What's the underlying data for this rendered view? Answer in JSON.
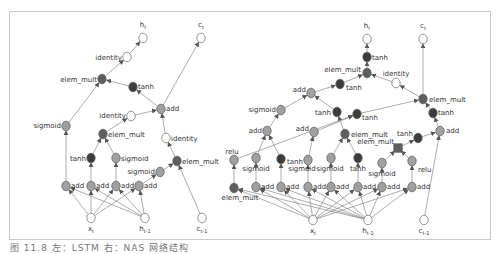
{
  "caption": "图 11.8  左：LSTM 右：NAS 网络结构",
  "colors": {
    "dark": "#3c3c3c",
    "medium": "#5e5e5e",
    "light": "#a0a0a0",
    "white": "#ffffff",
    "stroke": "#7a7a7a",
    "edge": "#8a8a8a"
  },
  "graphs": [
    {
      "name": "lstm-cell",
      "nodes": [
        {
          "id": "ht",
          "x": 143,
          "y": 38,
          "type": "white",
          "label": "h",
          "sub": "t",
          "lx": 143,
          "ly": 27,
          "anchor": "middle",
          "kind": "output"
        },
        {
          "id": "ct",
          "x": 201,
          "y": 38,
          "type": "white",
          "label": "c",
          "sub": "t",
          "lx": 201,
          "ly": 27,
          "anchor": "middle",
          "kind": "output"
        },
        {
          "id": "id1",
          "x": 127,
          "y": 57,
          "type": "white",
          "label": "identity",
          "lx": 122,
          "ly": 60,
          "anchor": "end"
        },
        {
          "id": "em1",
          "x": 102,
          "y": 79,
          "type": "medium",
          "label": "elem_mult",
          "lx": 97,
          "ly": 82,
          "anchor": "end"
        },
        {
          "id": "th1",
          "x": 133,
          "y": 87,
          "type": "dark",
          "label": "tanh",
          "lx": 138,
          "ly": 89,
          "anchor": "start"
        },
        {
          "id": "add1",
          "x": 161,
          "y": 109,
          "type": "light",
          "label": "add",
          "lx": 166,
          "ly": 111,
          "anchor": "start"
        },
        {
          "id": "sg1",
          "x": 66,
          "y": 126,
          "type": "light",
          "label": "sigmoid",
          "lx": 61,
          "ly": 128,
          "anchor": "end"
        },
        {
          "id": "id2",
          "x": 131,
          "y": 116,
          "type": "white",
          "label": "identity",
          "lx": 126,
          "ly": 118,
          "anchor": "end"
        },
        {
          "id": "em2",
          "x": 103,
          "y": 134,
          "type": "medium",
          "label": "elem_mult",
          "lx": 108,
          "ly": 137,
          "anchor": "start"
        },
        {
          "id": "id3",
          "x": 166,
          "y": 138,
          "type": "white",
          "label": "identity",
          "lx": 171,
          "ly": 141,
          "anchor": "start"
        },
        {
          "id": "th2",
          "x": 91,
          "y": 158,
          "type": "dark",
          "label": "tanh",
          "lx": 86,
          "ly": 161,
          "anchor": "end"
        },
        {
          "id": "sg2",
          "x": 116,
          "y": 158,
          "type": "light",
          "label": "sigmoid",
          "lx": 121,
          "ly": 161,
          "anchor": "start"
        },
        {
          "id": "em3",
          "x": 177,
          "y": 161,
          "type": "medium",
          "label": "elem_mult",
          "lx": 182,
          "ly": 164,
          "anchor": "start"
        },
        {
          "id": "sg3",
          "x": 160,
          "y": 172,
          "type": "light",
          "label": "sigmoid",
          "lx": 155,
          "ly": 174,
          "anchor": "end"
        },
        {
          "id": "a1",
          "x": 66,
          "y": 186,
          "type": "light",
          "label": "add",
          "lx": 71,
          "ly": 188,
          "anchor": "start"
        },
        {
          "id": "a2",
          "x": 91,
          "y": 186,
          "type": "light",
          "label": "add",
          "lx": 96,
          "ly": 188,
          "anchor": "start"
        },
        {
          "id": "a3",
          "x": 116,
          "y": 186,
          "type": "light",
          "label": "add",
          "lx": 121,
          "ly": 188,
          "anchor": "start"
        },
        {
          "id": "a4",
          "x": 139,
          "y": 186,
          "type": "light",
          "label": "add",
          "lx": 144,
          "ly": 188,
          "anchor": "start"
        },
        {
          "id": "xt",
          "x": 91,
          "y": 218,
          "type": "white",
          "label": "x",
          "sub": "t",
          "lx": 91,
          "ly": 231,
          "anchor": "middle",
          "kind": "input"
        },
        {
          "id": "htm1",
          "x": 145,
          "y": 218,
          "type": "white",
          "label": "h",
          "sub": "t-1",
          "lx": 145,
          "ly": 231,
          "anchor": "middle",
          "kind": "input"
        },
        {
          "id": "ctm1",
          "x": 202,
          "y": 218,
          "type": "white",
          "label": "c",
          "sub": "t-1",
          "lx": 202,
          "ly": 231,
          "anchor": "middle",
          "kind": "input"
        }
      ],
      "edges": [
        [
          "id1",
          "ht"
        ],
        [
          "em1",
          "id1"
        ],
        [
          "th1",
          "em1"
        ],
        [
          "add1",
          "th1"
        ],
        [
          "add1",
          "ct"
        ],
        [
          "sg1",
          "em1"
        ],
        [
          "id2",
          "add1"
        ],
        [
          "em2",
          "id2"
        ],
        [
          "id3",
          "add1"
        ],
        [
          "em3",
          "id3"
        ],
        [
          "th2",
          "em2"
        ],
        [
          "sg2",
          "em2"
        ],
        [
          "sg3",
          "em3"
        ],
        [
          "ctm1",
          "em3"
        ],
        [
          "a1",
          "sg1"
        ],
        [
          "a2",
          "th2"
        ],
        [
          "a3",
          "sg2"
        ],
        [
          "a4",
          "sg3"
        ],
        [
          "xt",
          "a1"
        ],
        [
          "xt",
          "a2"
        ],
        [
          "xt",
          "a3"
        ],
        [
          "xt",
          "a4"
        ],
        [
          "htm1",
          "a1"
        ],
        [
          "htm1",
          "a2"
        ],
        [
          "htm1",
          "a3"
        ],
        [
          "htm1",
          "a4"
        ]
      ]
    },
    {
      "name": "nas-cell",
      "nodes": [
        {
          "id": "ht",
          "x": 367,
          "y": 39,
          "type": "white",
          "label": "h",
          "sub": "t",
          "lx": 367,
          "ly": 28,
          "anchor": "middle",
          "kind": "output"
        },
        {
          "id": "ct",
          "x": 423,
          "y": 39,
          "type": "white",
          "label": "c",
          "sub": "t",
          "lx": 423,
          "ly": 28,
          "anchor": "middle",
          "kind": "output"
        },
        {
          "id": "th1",
          "x": 367,
          "y": 57,
          "type": "dark",
          "label": "tanh",
          "lx": 372,
          "ly": 60,
          "anchor": "start"
        },
        {
          "id": "em1",
          "x": 367,
          "y": 73,
          "type": "medium",
          "label": "elem_mult",
          "lx": 361,
          "ly": 72,
          "anchor": "end"
        },
        {
          "id": "th2",
          "x": 340,
          "y": 84,
          "type": "dark",
          "label": "tanh",
          "lx": 346,
          "ly": 90,
          "anchor": "start"
        },
        {
          "id": "id1",
          "x": 396,
          "y": 83,
          "type": "white",
          "label": "identity",
          "lx": 396,
          "ly": 76,
          "anchor": "middle"
        },
        {
          "id": "add1",
          "x": 311,
          "y": 93,
          "type": "light",
          "label": "add",
          "lx": 306,
          "ly": 92,
          "anchor": "end"
        },
        {
          "id": "em2",
          "x": 423,
          "y": 99,
          "type": "medium",
          "label": "elem_mult",
          "lx": 429,
          "ly": 102,
          "anchor": "start"
        },
        {
          "id": "sg1",
          "x": 281,
          "y": 110,
          "type": "light",
          "label": "sigmoid",
          "lx": 276,
          "ly": 112,
          "anchor": "end"
        },
        {
          "id": "th3",
          "x": 337,
          "y": 112,
          "type": "dark",
          "label": "tanh",
          "lx": 331,
          "ly": 115,
          "anchor": "end"
        },
        {
          "id": "th4",
          "x": 357,
          "y": 114,
          "type": "dark",
          "label": "tanh",
          "lx": 362,
          "ly": 120,
          "anchor": "start"
        },
        {
          "id": "th5",
          "x": 433,
          "y": 113,
          "type": "dark",
          "label": "tanh",
          "lx": 438,
          "ly": 115,
          "anchor": "start"
        },
        {
          "id": "add2",
          "x": 267,
          "y": 131,
          "type": "light",
          "label": "add",
          "lx": 262,
          "ly": 133,
          "anchor": "end"
        },
        {
          "id": "add3",
          "x": 314,
          "y": 132,
          "type": "light",
          "label": "add",
          "lx": 309,
          "ly": 131,
          "anchor": "end"
        },
        {
          "id": "em3",
          "x": 345,
          "y": 134,
          "type": "medium",
          "label": "elem_mult",
          "lx": 351,
          "ly": 137,
          "anchor": "start"
        },
        {
          "id": "add4",
          "x": 440,
          "y": 131,
          "type": "light",
          "label": "add",
          "lx": 446,
          "ly": 133,
          "anchor": "start"
        },
        {
          "id": "th6",
          "x": 418,
          "y": 138,
          "type": "dark",
          "label": "tanh",
          "lx": 413,
          "ly": 136,
          "anchor": "end"
        },
        {
          "id": "em4",
          "x": 398,
          "y": 148,
          "type": "medium",
          "label": "elem_mult",
          "lx": 394,
          "ly": 144,
          "anchor": "end",
          "shape": "square"
        },
        {
          "id": "relu1",
          "x": 234,
          "y": 160,
          "type": "light",
          "label": "relu",
          "lx": 232,
          "ly": 154,
          "anchor": "middle"
        },
        {
          "id": "sg2",
          "x": 256,
          "y": 158,
          "type": "light",
          "label": "sigmoid",
          "lx": 256,
          "ly": 171,
          "anchor": "middle"
        },
        {
          "id": "th7",
          "x": 281,
          "y": 159,
          "type": "dark",
          "label": "tanh",
          "lx": 287,
          "ly": 164,
          "anchor": "start"
        },
        {
          "id": "sg3",
          "x": 308,
          "y": 160,
          "type": "light",
          "label": "sigmoid",
          "lx": 302,
          "ly": 171,
          "anchor": "middle"
        },
        {
          "id": "sg4",
          "x": 331,
          "y": 158,
          "type": "light",
          "label": "sigmoid",
          "lx": 330,
          "ly": 171,
          "anchor": "middle"
        },
        {
          "id": "th8",
          "x": 358,
          "y": 158,
          "type": "dark",
          "label": "tanh",
          "lx": 358,
          "ly": 171,
          "anchor": "middle"
        },
        {
          "id": "sg5",
          "x": 382,
          "y": 163,
          "type": "light",
          "label": "sigmoid",
          "lx": 382,
          "ly": 176,
          "anchor": "middle"
        },
        {
          "id": "relu2",
          "x": 412,
          "y": 161,
          "type": "light",
          "label": "relu",
          "lx": 418,
          "ly": 172,
          "anchor": "start"
        },
        {
          "id": "em5",
          "x": 234,
          "y": 188,
          "type": "medium",
          "label": "elem_mult",
          "lx": 240,
          "ly": 200,
          "anchor": "middle"
        },
        {
          "id": "b1",
          "x": 256,
          "y": 187,
          "type": "light",
          "label": "add",
          "lx": 261,
          "ly": 189,
          "anchor": "start"
        },
        {
          "id": "b2",
          "x": 281,
          "y": 187,
          "type": "light",
          "label": "add",
          "lx": 286,
          "ly": 189,
          "anchor": "start"
        },
        {
          "id": "b3",
          "x": 308,
          "y": 187,
          "type": "light",
          "label": "add",
          "lx": 313,
          "ly": 189,
          "anchor": "start"
        },
        {
          "id": "b4",
          "x": 331,
          "y": 187,
          "type": "light",
          "label": "add",
          "lx": 336,
          "ly": 189,
          "anchor": "start"
        },
        {
          "id": "b5",
          "x": 358,
          "y": 187,
          "type": "light",
          "label": "add",
          "lx": 363,
          "ly": 189,
          "anchor": "start"
        },
        {
          "id": "b6",
          "x": 382,
          "y": 187,
          "type": "light",
          "label": "add",
          "lx": 387,
          "ly": 189,
          "anchor": "start"
        },
        {
          "id": "b7",
          "x": 412,
          "y": 187,
          "type": "light",
          "label": "add",
          "lx": 417,
          "ly": 189,
          "anchor": "start"
        },
        {
          "id": "xt",
          "x": 313,
          "y": 220,
          "type": "white",
          "label": "x",
          "sub": "t",
          "lx": 313,
          "ly": 233,
          "anchor": "middle",
          "kind": "input"
        },
        {
          "id": "htm1",
          "x": 368,
          "y": 220,
          "type": "white",
          "label": "h",
          "sub": "t-1",
          "lx": 368,
          "ly": 233,
          "anchor": "middle",
          "kind": "input"
        },
        {
          "id": "ctm1",
          "x": 424,
          "y": 220,
          "type": "white",
          "label": "c",
          "sub": "t-1",
          "lx": 424,
          "ly": 233,
          "anchor": "middle",
          "kind": "input"
        }
      ],
      "edges": [
        [
          "th1",
          "ht"
        ],
        [
          "em1",
          "th1"
        ],
        [
          "th2",
          "em1"
        ],
        [
          "id1",
          "em1"
        ],
        [
          "em2",
          "id1"
        ],
        [
          "em2",
          "ct"
        ],
        [
          "add1",
          "th2"
        ],
        [
          "sg1",
          "add1"
        ],
        [
          "th3",
          "add1"
        ],
        [
          "th4",
          "em2"
        ],
        [
          "th5",
          "em2"
        ],
        [
          "add4",
          "th5"
        ],
        [
          "add2",
          "sg1"
        ],
        [
          "em3",
          "th3"
        ],
        [
          "relu1",
          "th4"
        ],
        [
          "th6",
          "add4"
        ],
        [
          "ctm1",
          "add4"
        ],
        [
          "em4",
          "th6"
        ],
        [
          "sg2",
          "add2"
        ],
        [
          "th7",
          "add2"
        ],
        [
          "sg3",
          "add3"
        ],
        [
          "add3",
          "th4"
        ],
        [
          "sg4",
          "em3"
        ],
        [
          "th8",
          "em3"
        ],
        [
          "sg5",
          "em4"
        ],
        [
          "relu2",
          "em4"
        ],
        [
          "em5",
          "relu1"
        ],
        [
          "b1",
          "sg2"
        ],
        [
          "b2",
          "th7"
        ],
        [
          "b3",
          "sg3"
        ],
        [
          "b4",
          "sg4"
        ],
        [
          "b5",
          "th8"
        ],
        [
          "b6",
          "sg5"
        ],
        [
          "b7",
          "relu2"
        ],
        [
          "xt",
          "em5"
        ],
        [
          "xt",
          "b1"
        ],
        [
          "xt",
          "b2"
        ],
        [
          "xt",
          "b3"
        ],
        [
          "xt",
          "b4"
        ],
        [
          "xt",
          "b5"
        ],
        [
          "xt",
          "b6"
        ],
        [
          "xt",
          "b7"
        ],
        [
          "htm1",
          "em5"
        ],
        [
          "htm1",
          "b1"
        ],
        [
          "htm1",
          "b2"
        ],
        [
          "htm1",
          "b3"
        ],
        [
          "htm1",
          "b4"
        ],
        [
          "htm1",
          "b5"
        ],
        [
          "htm1",
          "b6"
        ],
        [
          "htm1",
          "b7"
        ]
      ]
    }
  ]
}
